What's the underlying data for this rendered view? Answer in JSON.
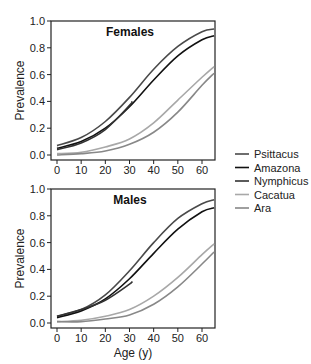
{
  "chart_data": [
    {
      "type": "line",
      "title": "Females",
      "xlabel": "",
      "ylabel": "Prevalence",
      "xlim": [
        -2,
        66
      ],
      "ylim": [
        0,
        1.0
      ],
      "xticks": [
        0,
        10,
        20,
        30,
        40,
        50,
        60
      ],
      "yticks": [
        "0.0",
        "0.2",
        "0.4",
        "0.6",
        "0.8",
        "1.0"
      ],
      "grid": false,
      "series": [
        {
          "name": "Psittacus",
          "color": "#4a4a4a",
          "x": [
            0,
            10,
            20,
            30,
            40,
            50,
            60,
            65
          ],
          "values": [
            0.07,
            0.13,
            0.25,
            0.43,
            0.64,
            0.81,
            0.92,
            0.94
          ]
        },
        {
          "name": "Amazona",
          "color": "#111111",
          "x": [
            0,
            10,
            20,
            30,
            40,
            50,
            60,
            65
          ],
          "values": [
            0.05,
            0.1,
            0.2,
            0.36,
            0.56,
            0.74,
            0.86,
            0.89
          ]
        },
        {
          "name": "Nymphicus",
          "color": "#333333",
          "x": [
            0,
            10,
            20,
            30,
            31
          ],
          "values": [
            0.04,
            0.09,
            0.19,
            0.37,
            0.4
          ]
        },
        {
          "name": "Cacatua",
          "color": "#a8a8a8",
          "x": [
            0,
            10,
            20,
            30,
            40,
            50,
            60,
            65
          ],
          "values": [
            0.01,
            0.02,
            0.06,
            0.12,
            0.24,
            0.41,
            0.58,
            0.66
          ]
        },
        {
          "name": "Ara",
          "color": "#888888",
          "x": [
            0,
            10,
            20,
            30,
            40,
            50,
            60,
            65
          ],
          "values": [
            0.0,
            0.01,
            0.03,
            0.08,
            0.17,
            0.32,
            0.52,
            0.61
          ]
        }
      ]
    },
    {
      "type": "line",
      "title": "Males",
      "xlabel": "Age (y)",
      "ylabel": "Prevalence",
      "xlim": [
        -2,
        66
      ],
      "ylim": [
        0,
        1.0
      ],
      "xticks": [
        0,
        10,
        20,
        30,
        40,
        50,
        60
      ],
      "yticks": [
        "0.0",
        "0.2",
        "0.4",
        "0.6",
        "0.8",
        "1.0"
      ],
      "grid": false,
      "series": [
        {
          "name": "Psittacus",
          "color": "#4a4a4a",
          "x": [
            0,
            10,
            20,
            30,
            40,
            50,
            60,
            65
          ],
          "values": [
            0.05,
            0.1,
            0.21,
            0.39,
            0.6,
            0.78,
            0.89,
            0.92
          ]
        },
        {
          "name": "Amazona",
          "color": "#111111",
          "x": [
            0,
            10,
            20,
            30,
            40,
            50,
            60,
            65
          ],
          "values": [
            0.04,
            0.09,
            0.18,
            0.33,
            0.52,
            0.7,
            0.83,
            0.86
          ]
        },
        {
          "name": "Nymphicus",
          "color": "#333333",
          "x": [
            0,
            10,
            20,
            30,
            31
          ],
          "values": [
            0.05,
            0.1,
            0.17,
            0.29,
            0.31
          ]
        },
        {
          "name": "Cacatua",
          "color": "#a8a8a8",
          "x": [
            0,
            10,
            20,
            30,
            40,
            50,
            60,
            65
          ],
          "values": [
            0.01,
            0.02,
            0.05,
            0.1,
            0.2,
            0.34,
            0.51,
            0.59
          ]
        },
        {
          "name": "Ara",
          "color": "#888888",
          "x": [
            0,
            10,
            20,
            30,
            40,
            50,
            60,
            65
          ],
          "values": [
            0.01,
            0.01,
            0.03,
            0.06,
            0.14,
            0.27,
            0.44,
            0.53
          ]
        }
      ]
    }
  ],
  "legend": {
    "position": "right",
    "entries": [
      {
        "label": "Psittacus",
        "color": "#4a4a4a"
      },
      {
        "label": "Amazona",
        "color": "#111111"
      },
      {
        "label": "Nymphicus",
        "color": "#333333"
      },
      {
        "label": "Cacatua",
        "color": "#a8a8a8"
      },
      {
        "label": "Ara",
        "color": "#888888"
      }
    ]
  }
}
